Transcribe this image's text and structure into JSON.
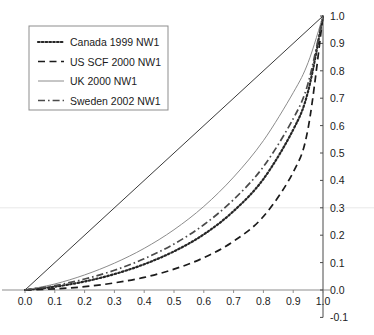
{
  "chart_data": {
    "type": "line",
    "title": "",
    "subtitle": "",
    "xlabel": "",
    "ylabel": "",
    "xlim": [
      0.0,
      1.0
    ],
    "ylim": [
      -0.1,
      1.0
    ],
    "grid": false,
    "legend_position": "top-left",
    "x_ticks": [
      "0.0",
      "0.1",
      "0.2",
      "0.3",
      "0.4",
      "0.5",
      "0.6",
      "0.7",
      "0.8",
      "0.9",
      "1.0"
    ],
    "x_tick_values": [
      0.0,
      0.1,
      0.2,
      0.3,
      0.4,
      0.5,
      0.6,
      0.7,
      0.8,
      0.9,
      1.0
    ],
    "y_ticks": [
      "1.0",
      "0.9",
      "0.8",
      "0.7",
      "0.6",
      "0.5",
      "0.4",
      "0.3",
      "0.2",
      "0.1",
      "0.0",
      "-0.1"
    ],
    "y_tick_values": [
      1.0,
      0.9,
      0.8,
      0.7,
      0.6,
      0.5,
      0.4,
      0.3,
      0.2,
      0.1,
      0.0,
      -0.1
    ],
    "x": [
      0.0,
      0.1,
      0.2,
      0.3,
      0.4,
      0.5,
      0.6,
      0.7,
      0.8,
      0.9,
      0.95,
      1.0
    ],
    "series": [
      {
        "name": "Canada 1999 NW1",
        "style": "dotted",
        "color": "#262626",
        "values": [
          0.0,
          0.012,
          0.031,
          0.058,
          0.094,
          0.141,
          0.203,
          0.288,
          0.405,
          0.585,
          0.725,
          1.0
        ]
      },
      {
        "name": "US SCF 2000 NW1",
        "style": "dashed",
        "color": "#1b1b1b",
        "values": [
          0.0,
          0.004,
          0.012,
          0.026,
          0.046,
          0.076,
          0.118,
          0.178,
          0.268,
          0.43,
          0.59,
          1.0
        ]
      },
      {
        "name": "UK 2000 NW1",
        "style": "solid",
        "color": "#8c8c8c",
        "values": [
          0.0,
          0.022,
          0.055,
          0.098,
          0.152,
          0.22,
          0.305,
          0.412,
          0.545,
          0.72,
          0.83,
          1.0
        ]
      },
      {
        "name": "Sweden 2002 NW1",
        "style": "dashdot",
        "color": "#4a4a4a",
        "values": [
          0.0,
          0.016,
          0.04,
          0.072,
          0.114,
          0.168,
          0.238,
          0.33,
          0.45,
          0.625,
          0.755,
          1.0
        ]
      }
    ],
    "reference_line": {
      "name": "line-of-equality",
      "style": "solid",
      "color": "#3a3a3a",
      "from": [
        0.0,
        0.0
      ],
      "to": [
        1.0,
        1.0
      ]
    },
    "legend_entries": [
      {
        "label": "Canada 1999 NW1",
        "style": "dotted"
      },
      {
        "label": "US SCF 2000 NW1",
        "style": "dashed"
      },
      {
        "label": "UK 2000 NW1",
        "style": "solid"
      },
      {
        "label": "Sweden 2002 NW1",
        "style": "dashdot"
      }
    ]
  }
}
